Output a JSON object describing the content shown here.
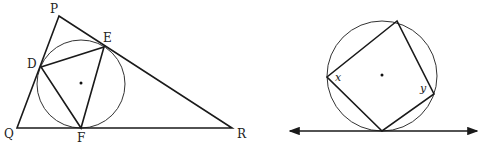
{
  "figures": [
    {
      "name": "triangle-with-incircle",
      "description": "Triangle PQR with inscribed circle tangent at D, E, F; triangle DEF inscribed in circle",
      "labels": {
        "P": "P",
        "Q": "Q",
        "R": "R",
        "D": "D",
        "E": "E",
        "F": "F"
      }
    },
    {
      "name": "circle-with-inscribed-quadrilateral",
      "description": "Circle with inscribed quadrilateral tangent to a horizontal line at the bottom vertex",
      "labels": {
        "x": "x",
        "y": "y"
      }
    }
  ]
}
